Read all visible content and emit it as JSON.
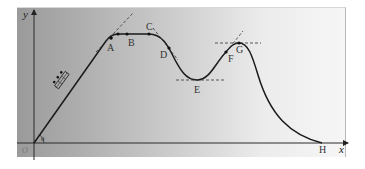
{
  "diagram": {
    "title": "",
    "axes": {
      "y_label": "y",
      "x_label": "x",
      "origin_label": "O",
      "angle_label": "θ"
    },
    "points": [
      {
        "id": "A",
        "label": "A"
      },
      {
        "id": "B",
        "label": "B"
      },
      {
        "id": "C",
        "label": "C"
      },
      {
        "id": "D",
        "label": "D"
      },
      {
        "id": "E",
        "label": "E"
      },
      {
        "id": "F",
        "label": "F"
      },
      {
        "id": "G",
        "label": "G"
      },
      {
        "id": "H",
        "label": "H"
      }
    ]
  },
  "colors": {
    "curve": "#1a1a1a",
    "axes": "#2a2a2a",
    "dash": "#333333"
  }
}
